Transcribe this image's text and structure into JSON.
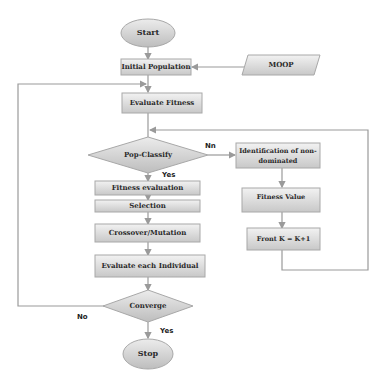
{
  "diagram": {
    "colors": {
      "node_fill_top": "#efefef",
      "node_fill_bottom": "#c9c9c9",
      "node_stroke": "#a8a8a8",
      "connector": "#9a9a9a",
      "text": "#2a2a2a"
    },
    "nodes": {
      "start": "Start",
      "initial_population": "Initial Population",
      "moop": "MOOP",
      "evaluate_fitness": "Evaluate Fitness",
      "pop_classify": "Pop-Classify",
      "fitness_evaluation": "Fitness evaluation",
      "selection": "Selection",
      "crossover_mutation": "Crossover/Mutation",
      "evaluate_each_individual": "Evaluate each Individual",
      "converge": "Converge",
      "stop": "Stop",
      "identification_line1": "Identification of non-",
      "identification_line2": "dominated",
      "fitness_value": "Fitness Value",
      "front_k": "Front K = K+1"
    },
    "edge_labels": {
      "pop_classify_no": "Nn",
      "pop_classify_yes": "Yes",
      "converge_no": "No",
      "converge_yes": "Yes"
    }
  }
}
